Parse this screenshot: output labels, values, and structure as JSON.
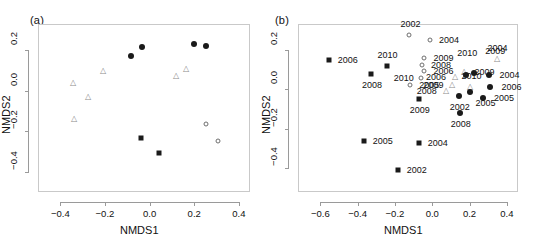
{
  "figure": {
    "width": 539,
    "height": 248,
    "background": "#ffffff",
    "frame_color": "#c9c9c9",
    "marker_color": "#1a1a1a",
    "open_marker_color": "#6e6e6e"
  },
  "chart_data": [
    {
      "type": "scatter",
      "panel": "a",
      "title": "(a)",
      "xlabel": "NMDS1",
      "ylabel": "NMDS2",
      "xlim": [
        -0.5,
        0.45
      ],
      "ylim": [
        -0.5,
        0.33
      ],
      "xticks": [
        "-0.4",
        "-0.2",
        "0.0",
        "0.2",
        "0.4"
      ],
      "xtickvals": [
        -0.4,
        -0.2,
        0.0,
        0.2,
        0.4
      ],
      "yticks": [
        "0.2",
        "0.0",
        "-0.2",
        "-0.4"
      ],
      "ytickvals": [
        0.2,
        0.0,
        -0.2,
        -0.4
      ],
      "grid": false,
      "legend": "none",
      "series": [
        {
          "name": "filled-circle",
          "marker": "filled-circle",
          "points": [
            {
              "x": -0.085,
              "y": 0.172
            },
            {
              "x": -0.035,
              "y": 0.218
            },
            {
              "x": 0.197,
              "y": 0.233
            },
            {
              "x": 0.252,
              "y": 0.222
            }
          ]
        },
        {
          "name": "filled-square",
          "marker": "filled-square",
          "points": [
            {
              "x": -0.037,
              "y": -0.232
            },
            {
              "x": 0.04,
              "y": -0.305
            }
          ]
        },
        {
          "name": "open-circle",
          "marker": "open-circle",
          "points": [
            {
              "x": 0.252,
              "y": -0.162
            },
            {
              "x": 0.305,
              "y": -0.25
            }
          ]
        },
        {
          "name": "open-triangle",
          "marker": "open-triangle",
          "points": [
            {
              "x": -0.342,
              "y": 0.04
            },
            {
              "x": -0.278,
              "y": -0.032
            },
            {
              "x": -0.337,
              "y": -0.138
            },
            {
              "x": -0.208,
              "y": 0.098
            },
            {
              "x": 0.118,
              "y": 0.072
            },
            {
              "x": 0.163,
              "y": 0.108
            }
          ]
        }
      ]
    },
    {
      "type": "scatter",
      "panel": "b",
      "title": "(b)",
      "xlabel": "NMDS1",
      "ylabel": "NMDS2",
      "xlim": [
        -0.72,
        0.46
      ],
      "ylim": [
        -0.52,
        0.33
      ],
      "xticks": [
        "-0.6",
        "-0.4",
        "-0.2",
        "0.0",
        "0.2",
        "0.4"
      ],
      "xtickvals": [
        -0.6,
        -0.4,
        -0.2,
        0.0,
        0.2,
        0.4
      ],
      "yticks": [
        "0.2",
        "0.0",
        "-0.2",
        "-0.4"
      ],
      "ytickvals": [
        0.2,
        0.0,
        -0.2,
        -0.4
      ],
      "grid": false,
      "legend": "none",
      "series": [
        {
          "name": "filled-square",
          "marker": "filled-square",
          "points": [
            {
              "x": -0.555,
              "y": 0.148,
              "label": "2006",
              "lx": 18,
              "ly": 0
            },
            {
              "x": -0.245,
              "y": 0.118,
              "label": "2010",
              "lx": 0,
              "ly": -11
            },
            {
              "x": -0.328,
              "y": 0.078,
              "label": "2008",
              "lx": 0,
              "ly": 11
            },
            {
              "x": -0.072,
              "y": -0.048,
              "label": "2009",
              "lx": 0,
              "ly": 11
            },
            {
              "x": -0.367,
              "y": -0.262,
              "label": "2005",
              "lx": 18,
              "ly": 0
            },
            {
              "x": -0.185,
              "y": -0.408,
              "label": "2002",
              "lx": 18,
              "ly": 0
            },
            {
              "x": -0.072,
              "y": -0.272,
              "label": "2004",
              "lx": 18,
              "ly": 0
            }
          ]
        },
        {
          "name": "open-circle",
          "marker": "open-circle",
          "points": [
            {
              "x": -0.122,
              "y": 0.272,
              "label": "2002",
              "lx": 0,
              "ly": -11
            },
            {
              "x": -0.012,
              "y": 0.248,
              "label": "2004",
              "lx": 18,
              "ly": 0
            },
            {
              "x": -0.042,
              "y": 0.158,
              "label": "2009",
              "lx": 18,
              "ly": 0
            },
            {
              "x": -0.055,
              "y": 0.122,
              "label": "2008",
              "lx": 18,
              "ly": 0
            },
            {
              "x": -0.042,
              "y": 0.092,
              "label": "2006",
              "lx": 18,
              "ly": 0
            },
            {
              "x": -0.062,
              "y": 0.058,
              "label": "2010",
              "lx": -18,
              "ly": 0
            },
            {
              "x": -0.118,
              "y": 0.022,
              "label": "2005",
              "lx": 18,
              "ly": 0
            }
          ]
        },
        {
          "name": "open-triangle",
          "marker": "open-triangle",
          "points": [
            {
              "x": 0.345,
              "y": 0.155,
              "label": "2004",
              "lx": 0,
              "ly": -11
            },
            {
              "x": 0.168,
              "y": 0.088,
              "label": "2009",
              "lx": 20,
              "ly": 0
            },
            {
              "x": 0.122,
              "y": 0.062,
              "label": "2006",
              "lx": -20,
              "ly": 0
            },
            {
              "x": 0.108,
              "y": 0.022,
              "label": "2009",
              "lx": -20,
              "ly": 0
            },
            {
              "x": 0.072,
              "y": -0.008,
              "label": "2008",
              "lx": -20,
              "ly": 0
            },
            {
              "x": 0.205,
              "y": 0.012,
              "label": "2010",
              "lx": 0,
              "ly": -11
            }
          ]
        },
        {
          "name": "filled-circle",
          "marker": "filled-circle",
          "points": [
            {
              "x": 0.182,
              "y": 0.072,
              "label": "2010",
              "lx": 0,
              "ly": -22
            },
            {
              "x": 0.225,
              "y": 0.082,
              "label": "2009",
              "lx": 20,
              "ly": -22
            },
            {
              "x": 0.302,
              "y": 0.072,
              "label": "2004",
              "lx": 20,
              "ly": 0
            },
            {
              "x": 0.312,
              "y": 0.012,
              "label": "2006",
              "lx": 20,
              "ly": 0
            },
            {
              "x": 0.272,
              "y": -0.042,
              "label": "2005",
              "lx": 20,
              "ly": 0
            },
            {
              "x": 0.142,
              "y": -0.032,
              "label": "2002",
              "lx": 0,
              "ly": 11
            },
            {
              "x": 0.148,
              "y": -0.118,
              "label": "2008",
              "lx": 0,
              "ly": 11
            },
            {
              "x": 0.205,
              "y": -0.012,
              "label": "2005",
              "lx": 14,
              "ly": 11
            }
          ]
        }
      ]
    }
  ]
}
